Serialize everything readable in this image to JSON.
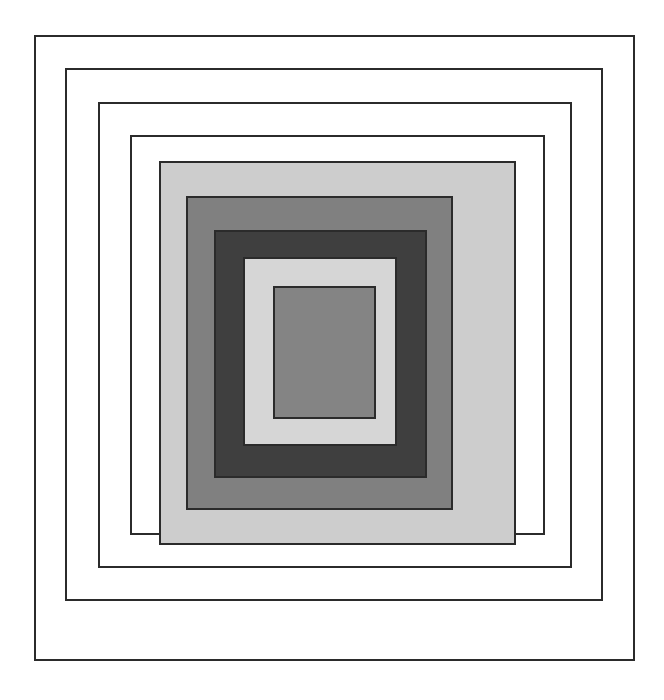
{
  "artwork": {
    "title": "Nested Concentric Squares",
    "background_color": "#ffffff",
    "outline_color": "#2b2b2b",
    "canvas": {
      "width": 664,
      "height": 700
    }
  },
  "chart_data": {
    "type": "nested-squares",
    "grid": false,
    "legend": false,
    "xlabel": "",
    "ylabel": "",
    "squares": [
      {
        "index": 1,
        "name": "frame-1-outer",
        "x": 34,
        "y": 35,
        "width": 601,
        "height": 626,
        "fill": "#ffffff",
        "stroke": "#2b2b2b",
        "stroke_width": 2
      },
      {
        "index": 2,
        "name": "frame-2",
        "x": 65,
        "y": 68,
        "width": 538,
        "height": 533,
        "fill": "#ffffff",
        "stroke": "#2b2b2b",
        "stroke_width": 2
      },
      {
        "index": 3,
        "name": "frame-3",
        "x": 98,
        "y": 102,
        "width": 474,
        "height": 466,
        "fill": "#ffffff",
        "stroke": "#2b2b2b",
        "stroke_width": 2
      },
      {
        "index": 4,
        "name": "frame-4",
        "x": 130,
        "y": 135,
        "width": 415,
        "height": 400,
        "fill": "#ffffff",
        "stroke": "#2b2b2b",
        "stroke_width": 2
      },
      {
        "index": 5,
        "name": "band-light-gray-outer",
        "x": 159,
        "y": 161,
        "width": 357,
        "height": 384,
        "fill": "#cdcdcd",
        "stroke": "#2b2b2b",
        "stroke_width": 2
      },
      {
        "index": 6,
        "name": "band-medium-gray",
        "x": 186,
        "y": 196,
        "width": 267,
        "height": 314,
        "fill": "#808080",
        "stroke": "#2b2b2b",
        "stroke_width": 2
      },
      {
        "index": 7,
        "name": "band-dark-gray",
        "x": 214,
        "y": 230,
        "width": 213,
        "height": 248,
        "fill": "#3f3f3f",
        "stroke": "#2b2b2b",
        "stroke_width": 2
      },
      {
        "index": 8,
        "name": "band-pale-gray",
        "x": 243,
        "y": 257,
        "width": 154,
        "height": 189,
        "fill": "#d6d6d6",
        "stroke": "#2b2b2b",
        "stroke_width": 2
      },
      {
        "index": 9,
        "name": "center-medium-gray",
        "x": 273,
        "y": 286,
        "width": 103,
        "height": 133,
        "fill": "#848484",
        "stroke": "#2b2b2b",
        "stroke_width": 2
      }
    ]
  }
}
